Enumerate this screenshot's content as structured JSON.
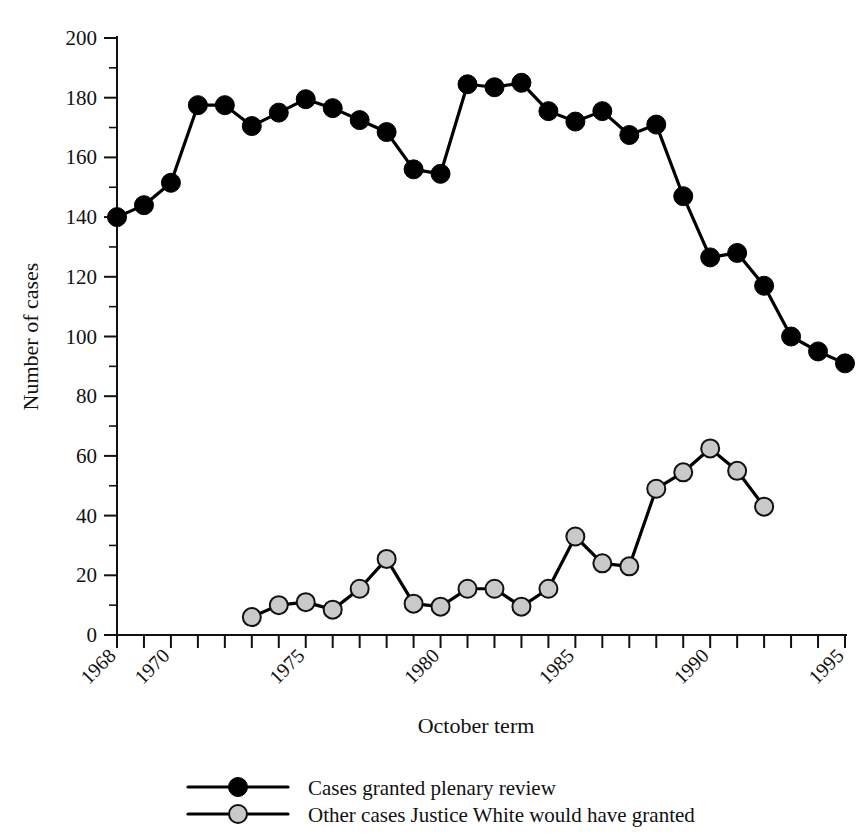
{
  "chart_data": {
    "type": "line",
    "title": "",
    "xlabel": "October term",
    "ylabel": "Number of cases",
    "xlim": [
      1968,
      1995
    ],
    "ylim": [
      0,
      200
    ],
    "grid": false,
    "legend_position": "bottom",
    "y_ticks_major": [
      0,
      20,
      40,
      60,
      80,
      100,
      120,
      140,
      160,
      180,
      200
    ],
    "y_tick_minor_step": 10,
    "x_ticks": [
      1968,
      1969,
      1970,
      1971,
      1972,
      1973,
      1974,
      1975,
      1976,
      1977,
      1978,
      1979,
      1980,
      1981,
      1982,
      1983,
      1984,
      1985,
      1986,
      1987,
      1988,
      1989,
      1990,
      1991,
      1992,
      1993,
      1994,
      1995
    ],
    "x_tick_labels": [
      {
        "x": 1968,
        "label": "1968"
      },
      {
        "x": 1970,
        "label": "1970"
      },
      {
        "x": 1975,
        "label": "1975"
      },
      {
        "x": 1980,
        "label": "1980"
      },
      {
        "x": 1985,
        "label": "1985"
      },
      {
        "x": 1990,
        "label": "1990"
      },
      {
        "x": 1995,
        "label": "1995"
      }
    ],
    "series": [
      {
        "name": "Cases granted plenary review",
        "color": "#000000",
        "marker": "filled-circle",
        "x": [
          1968,
          1969,
          1970,
          1971,
          1972,
          1973,
          1974,
          1975,
          1976,
          1977,
          1978,
          1979,
          1980,
          1981,
          1982,
          1983,
          1984,
          1985,
          1986,
          1987,
          1988,
          1989,
          1990,
          1991,
          1992,
          1993,
          1994,
          1995
        ],
        "values": [
          140,
          144,
          151.5,
          177.5,
          177.5,
          170.5,
          175,
          179.5,
          176.5,
          172.5,
          168.5,
          156,
          154.5,
          184.5,
          183.5,
          185,
          175.5,
          172,
          175.5,
          167.5,
          171,
          147,
          126.5,
          128,
          117,
          100,
          95,
          91
        ]
      },
      {
        "name": "Other cases Justice White would have granted",
        "color": "#c9c9c9",
        "marker": "open-circle",
        "x": [
          1973,
          1974,
          1975,
          1976,
          1977,
          1978,
          1979,
          1980,
          1981,
          1982,
          1983,
          1984,
          1985,
          1986,
          1987,
          1988,
          1989,
          1990,
          1991,
          1992
        ],
        "values": [
          6,
          10,
          11,
          8.5,
          15.5,
          25.5,
          10.5,
          9.5,
          15.5,
          15.5,
          9.5,
          15.5,
          33,
          24,
          23,
          49,
          54.5,
          62.5,
          55,
          43
        ]
      }
    ]
  },
  "legend": {
    "items": [
      {
        "label": "Cases granted plenary review",
        "color": "#000000",
        "marker": "filled-circle"
      },
      {
        "label": "Other cases Justice White would have granted",
        "color": "#c9c9c9",
        "marker": "open-circle"
      }
    ]
  },
  "axes": {
    "x_title": "October term",
    "y_title": "Number of cases"
  }
}
